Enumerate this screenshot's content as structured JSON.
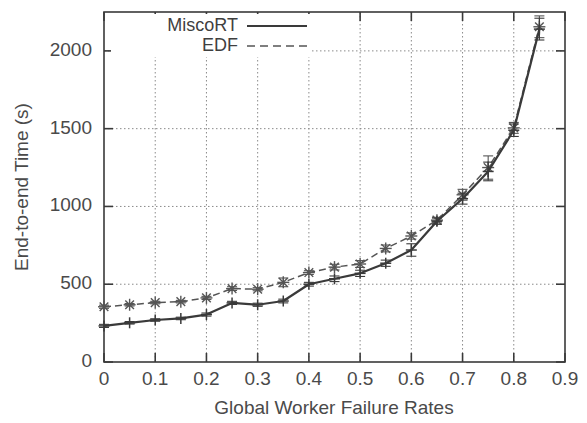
{
  "chart_data": {
    "type": "line",
    "title": "",
    "xlabel": "Global Worker Failure Rates",
    "ylabel": "End-to-end Time (s)",
    "xlim": [
      0,
      0.9
    ],
    "ylim": [
      0,
      2250
    ],
    "xticks": [
      "0",
      "0.1",
      "0.2",
      "0.3",
      "0.4",
      "0.5",
      "0.6",
      "0.7",
      "0.8",
      "0.9"
    ],
    "xtick_values": [
      0,
      0.1,
      0.2,
      0.3,
      0.4,
      0.5,
      0.6,
      0.7,
      0.8,
      0.9
    ],
    "yticks": [
      "0",
      "500",
      "1000",
      "1500",
      "2000"
    ],
    "ytick_values": [
      0,
      500,
      1000,
      1500,
      2000
    ],
    "grid": true,
    "grid_style": "dotted",
    "legend_position": "top-left",
    "x": [
      0,
      0.05,
      0.1,
      0.15,
      0.2,
      0.25,
      0.3,
      0.35,
      0.4,
      0.45,
      0.5,
      0.55,
      0.6,
      0.65,
      0.7,
      0.75,
      0.8,
      0.85
    ],
    "series": [
      {
        "name": "MiscoRT",
        "line_style": "solid",
        "marker": "plus",
        "color": "#3a3a3a",
        "values": [
          232,
          252,
          270,
          280,
          305,
          380,
          368,
          392,
          500,
          535,
          570,
          635,
          720,
          905,
          1050,
          1225,
          1490,
          2140
        ],
        "errors": [
          10,
          8,
          8,
          8,
          10,
          10,
          10,
          12,
          12,
          18,
          20,
          20,
          40,
          20,
          35,
          60,
          40,
          70
        ]
      },
      {
        "name": "EDF",
        "line_style": "dashed",
        "marker": "star",
        "color": "#555555",
        "values": [
          355,
          368,
          382,
          388,
          412,
          472,
          468,
          512,
          575,
          610,
          630,
          730,
          810,
          912,
          1075,
          1250,
          1505,
          2155
        ],
        "errors": [
          10,
          8,
          8,
          8,
          10,
          12,
          10,
          28,
          12,
          18,
          22,
          22,
          20,
          18,
          35,
          75,
          35,
          70
        ]
      }
    ]
  },
  "legend": {
    "entries": [
      {
        "label": "MiscoRT",
        "style": "solid"
      },
      {
        "label": "EDF",
        "style": "dashed"
      }
    ]
  }
}
